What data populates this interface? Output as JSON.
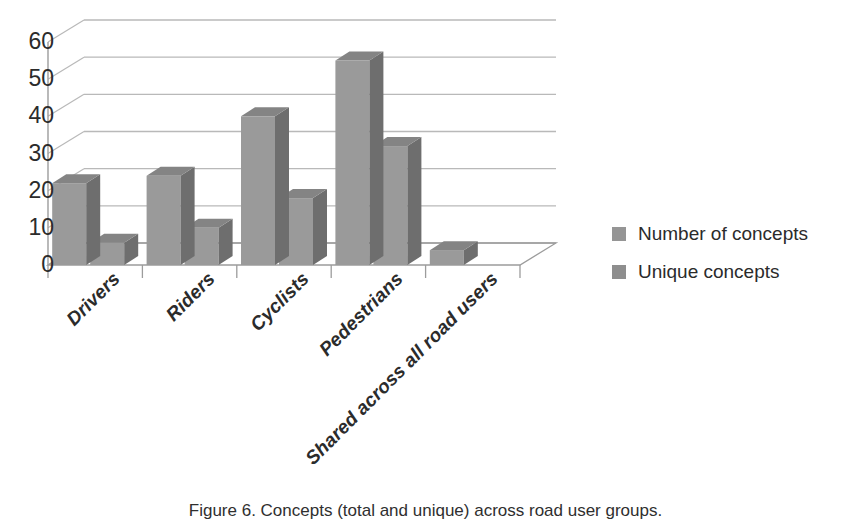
{
  "caption": "Figure 6. Concepts (total and unique) across road user groups.",
  "legend": {
    "position": "right",
    "items": [
      {
        "label": "Number of concepts",
        "color": "#959595",
        "swatch_icon": "square-swatch-icon"
      },
      {
        "label": "Unique concepts",
        "color": "#8e8e8e",
        "swatch_icon": "square-swatch-icon"
      }
    ]
  },
  "axes": {
    "y_ticks": [
      "60",
      "50",
      "40",
      "30",
      "20",
      "10",
      "0"
    ],
    "x_ticks": [
      "Drivers",
      "Riders",
      "Cyclists",
      "Pedestrians",
      "Shared across all road users"
    ]
  },
  "chart_data": {
    "type": "bar",
    "style": "3d-clustered-column",
    "title": "",
    "xlabel": "",
    "ylabel": "",
    "ylim": [
      0,
      60
    ],
    "ytick_step": 10,
    "grid": true,
    "legend_position": "right",
    "categories": [
      "Drivers",
      "Riders",
      "Cyclists",
      "Pedestrians",
      "Shared across all road users"
    ],
    "series": [
      {
        "name": "Number of concepts",
        "color": "#959595",
        "values": [
          22,
          24,
          40,
          55,
          4
        ]
      },
      {
        "name": "Unique concepts",
        "color": "#8e8e8e",
        "values": [
          6,
          10,
          18,
          32,
          0
        ]
      }
    ]
  },
  "colors": {
    "bar_front": "#9a9a9a",
    "bar_side": "#6e6e6e",
    "bar_top": "#848484",
    "gridline": "#b9b9b9",
    "axis_line": "#9c9c9c",
    "text": "#2b2b2b",
    "background": "#ffffff"
  }
}
